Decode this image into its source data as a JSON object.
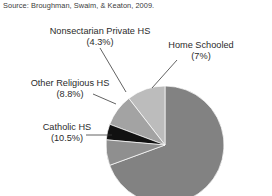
{
  "source": {
    "text": "Source: Broughman, Swaim, & Keaton, 2009."
  },
  "chart_data": {
    "type": "pie",
    "title": "",
    "subtitle": "",
    "xlabel": "",
    "ylabel": "",
    "legend_position": "none",
    "grid": false,
    "labels_shown": "callout",
    "categories": [
      "Public School",
      "Home Schooled",
      "Nonsectarian Private HS",
      "Other Religious HS",
      "Catholic HS"
    ],
    "values": [
      69.4,
      7,
      4.3,
      8.8,
      10.5
    ],
    "slices": [
      {
        "name": "Public School",
        "value": 69.4,
        "percent_label": "",
        "color": "#828282",
        "labeled": false
      },
      {
        "name": "Home Schooled",
        "value": 7,
        "percent_label": "(7%)",
        "color": "#8f8f8f",
        "labeled": true
      },
      {
        "name": "Nonsectarian Private HS",
        "value": 4.3,
        "percent_label": "(4.3%)",
        "color": "#111111",
        "labeled": true
      },
      {
        "name": "Other Religious HS",
        "value": 8.8,
        "percent_label": "(8.8%)",
        "color": "#a3a3a3",
        "labeled": true
      },
      {
        "name": "Catholic HS",
        "value": 10.5,
        "percent_label": "(10.5%)",
        "color": "#bcbcbc",
        "labeled": true
      }
    ]
  },
  "callouts": {
    "nonsectarian": {
      "name": "Nonsectarian Private HS",
      "percent": "(4.3%)"
    },
    "home_schooled": {
      "name": "Home Schooled",
      "percent": "(7%)"
    },
    "other_religious": {
      "name": "Other Religious HS",
      "percent": "(8.8%)"
    },
    "catholic": {
      "name": "Catholic HS",
      "percent": "(10.5%)"
    }
  }
}
